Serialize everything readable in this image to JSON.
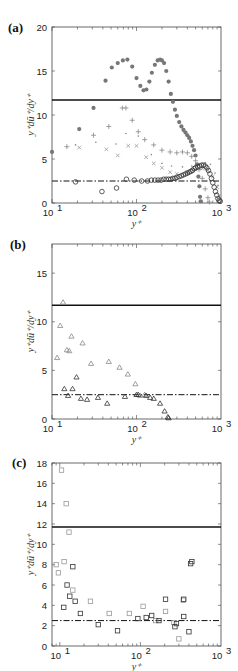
{
  "chart_data": [
    {
      "panel": "(a)",
      "type": "scatter",
      "title": "",
      "xlabel": "y+",
      "ylabel": "y+ dū+/dy+",
      "xscale": "log",
      "xlim": [
        10,
        1000
      ],
      "ylim": [
        0,
        20
      ],
      "xticks": [
        "10^1",
        "10^2",
        "10^3"
      ],
      "yticks": [
        0,
        5,
        10,
        15,
        20
      ],
      "grid": false,
      "reference_lines": [
        {
          "style": "solid",
          "y": 11.7
        },
        {
          "style": "dash-dot",
          "y": 2.5
        }
      ],
      "series": [
        {
          "name": "filled-circles",
          "marker": "filled-circle",
          "color": "#777777",
          "points": [
            [
              10,
              5.8
            ],
            [
              21,
              8.4
            ],
            [
              31,
              10.8
            ],
            [
              43,
              13.9
            ],
            [
              51,
              15.4
            ],
            [
              60,
              15.9
            ],
            [
              69,
              16.2
            ],
            [
              78,
              16.3
            ],
            [
              89,
              15.5
            ],
            [
              100,
              14.2
            ],
            [
              111,
              13.3
            ],
            [
              121,
              12.8
            ],
            [
              131,
              12.9
            ],
            [
              142,
              13.8
            ],
            [
              152,
              14.8
            ],
            [
              165,
              15.7
            ],
            [
              178,
              16.2
            ],
            [
              190,
              16.3
            ],
            [
              200,
              16.2
            ],
            [
              212,
              15.9
            ],
            [
              225,
              15.0
            ],
            [
              240,
              13.8
            ],
            [
              255,
              12.4
            ],
            [
              270,
              11.5
            ],
            [
              285,
              10.6
            ],
            [
              300,
              9.9
            ],
            [
              320,
              9.2
            ],
            [
              340,
              8.7
            ],
            [
              360,
              8.3
            ],
            [
              380,
              8.0
            ],
            [
              400,
              7.7
            ],
            [
              420,
              7.4
            ],
            [
              440,
              7.0
            ],
            [
              460,
              6.5
            ],
            [
              480,
              6.0
            ],
            [
              500,
              5.4
            ],
            [
              520,
              4.4
            ],
            [
              540,
              3.0
            ],
            [
              555,
              1.9
            ],
            [
              565,
              0.7
            ],
            [
              575,
              0.2
            ]
          ]
        },
        {
          "name": "plus",
          "marker": "plus",
          "color": "#888888",
          "points": [
            [
              15,
              6.4
            ],
            [
              31,
              7.7
            ],
            [
              47,
              8.7
            ],
            [
              68,
              10.8
            ],
            [
              75,
              10.8
            ],
            [
              89,
              9.4
            ],
            [
              105,
              8.1
            ],
            [
              125,
              7.2
            ],
            [
              160,
              6.6
            ],
            [
              200,
              6.0
            ],
            [
              250,
              5.8
            ],
            [
              300,
              5.7
            ],
            [
              350,
              5.8
            ],
            [
              400,
              5.7
            ],
            [
              450,
              5.3
            ],
            [
              500,
              4.8
            ],
            [
              550,
              3.8
            ],
            [
              600,
              2.8
            ],
            [
              650,
              1.6
            ],
            [
              700,
              0.6
            ],
            [
              730,
              0.1
            ]
          ]
        },
        {
          "name": "cross-x",
          "marker": "x",
          "color": "#999999",
          "points": [
            [
              21,
              6.3
            ],
            [
              44,
              6.1
            ],
            [
              60,
              5.4
            ],
            [
              80,
              6.5
            ],
            [
              100,
              6.5
            ],
            [
              130,
              5.2
            ],
            [
              160,
              4.5
            ],
            [
              200,
              4.0
            ],
            [
              250,
              3.5
            ],
            [
              300,
              3.3
            ],
            [
              400,
              3.5
            ],
            [
              500,
              3.8
            ],
            [
              600,
              3.9
            ],
            [
              700,
              3.7
            ],
            [
              800,
              3.0
            ],
            [
              900,
              1.8
            ],
            [
              950,
              0.8
            ]
          ]
        },
        {
          "name": "dots",
          "marker": "dot",
          "color": "#888888",
          "points": [
            [
              19,
              6.6
            ],
            [
              33,
              6.9
            ],
            [
              57,
              6.7
            ],
            [
              75,
              7.9
            ],
            [
              105,
              7.6
            ],
            [
              150,
              5.5
            ],
            [
              200,
              4.5
            ],
            [
              260,
              4.2
            ],
            [
              350,
              4.1
            ],
            [
              450,
              4.2
            ],
            [
              550,
              4.4
            ],
            [
              650,
              4.6
            ],
            [
              750,
              4.4
            ],
            [
              850,
              3.4
            ],
            [
              920,
              2.0
            ],
            [
              980,
              0.6
            ]
          ]
        },
        {
          "name": "open-circles",
          "marker": "open-circle",
          "color": "#333333",
          "points": [
            [
              19,
              2.4
            ],
            [
              39,
              1.3
            ],
            [
              58,
              1.7
            ],
            [
              76,
              2.7
            ],
            [
              94,
              2.6
            ],
            [
              115,
              2.5
            ],
            [
              135,
              2.5
            ],
            [
              150,
              2.6
            ],
            [
              165,
              2.6
            ],
            [
              180,
              2.6
            ],
            [
              195,
              2.6
            ],
            [
              210,
              2.7
            ],
            [
              225,
              2.7
            ],
            [
              240,
              2.7
            ],
            [
              255,
              2.7
            ],
            [
              270,
              2.8
            ],
            [
              285,
              2.8
            ],
            [
              300,
              2.9
            ],
            [
              320,
              3.0
            ],
            [
              340,
              3.1
            ],
            [
              360,
              3.2
            ],
            [
              380,
              3.3
            ],
            [
              400,
              3.4
            ],
            [
              420,
              3.5
            ],
            [
              440,
              3.6
            ],
            [
              460,
              3.7
            ],
            [
              480,
              3.9
            ],
            [
              500,
              4.0
            ],
            [
              530,
              4.1
            ],
            [
              560,
              4.2
            ],
            [
              590,
              4.3
            ],
            [
              620,
              4.3
            ],
            [
              650,
              4.2
            ],
            [
              680,
              4.0
            ],
            [
              710,
              3.7
            ],
            [
              740,
              3.3
            ],
            [
              770,
              2.8
            ],
            [
              800,
              2.3
            ],
            [
              830,
              1.8
            ],
            [
              860,
              1.3
            ],
            [
              890,
              0.9
            ],
            [
              920,
              0.5
            ],
            [
              950,
              0.3
            ],
            [
              980,
              0.2
            ]
          ]
        }
      ]
    },
    {
      "panel": "(b)",
      "type": "scatter",
      "title": "",
      "xlabel": "y+",
      "ylabel": "y+ dū+/dy+",
      "xscale": "log",
      "xlim": [
        10,
        1000
      ],
      "ylim": [
        0,
        18
      ],
      "xticks": [
        "10^1",
        "10^2",
        "10^3"
      ],
      "yticks": [
        0,
        5,
        10,
        15
      ],
      "grid": false,
      "reference_lines": [
        {
          "style": "solid",
          "y": 11.7
        },
        {
          "style": "dash-dot",
          "y": 2.5
        }
      ],
      "series": [
        {
          "name": "triangles-light",
          "marker": "open-triangle",
          "color": "#888888",
          "points": [
            [
              11.5,
              6.3
            ],
            [
              12.5,
              9.6
            ],
            [
              13.5,
              12.0
            ],
            [
              15,
              7.1
            ],
            [
              16,
              7.0
            ],
            [
              17,
              8.5
            ],
            [
              23,
              7.8
            ],
            [
              29,
              5.7
            ],
            [
              47,
              5.9
            ],
            [
              63,
              5.3
            ],
            [
              79,
              4.6
            ],
            [
              97,
              3.6
            ],
            [
              110,
              2.4
            ],
            [
              125,
              2.5
            ]
          ]
        },
        {
          "name": "triangles-dark",
          "marker": "open-triangle",
          "color": "#333333",
          "points": [
            [
              14,
              3.1
            ],
            [
              15.5,
              2.4
            ],
            [
              17.5,
              3.1
            ],
            [
              19.5,
              4.3
            ],
            [
              22,
              2.1
            ],
            [
              26,
              2.0
            ],
            [
              35,
              2.2
            ],
            [
              45,
              1.6
            ],
            [
              73,
              2.3
            ],
            [
              100,
              2.5
            ],
            [
              105,
              2.5
            ],
            [
              130,
              2.4
            ],
            [
              145,
              2.2
            ],
            [
              160,
              2.1
            ],
            [
              190,
              1.6
            ],
            [
              215,
              0.8
            ],
            [
              235,
              0.2
            ],
            [
              240,
              0.1
            ]
          ]
        }
      ]
    },
    {
      "panel": "(c)",
      "type": "scatter",
      "title": "",
      "xlabel": "y+",
      "ylabel": "y+ dū+/dy+",
      "xscale": "log",
      "xlim": [
        8,
        1000
      ],
      "ylim": [
        0,
        18
      ],
      "xticks": [
        "10^1",
        "10^2",
        "10^3"
      ],
      "yticks": [
        0,
        2,
        4,
        6,
        8,
        10,
        12,
        14,
        16,
        18
      ],
      "grid": false,
      "reference_lines": [
        {
          "style": "solid",
          "y": 11.7
        },
        {
          "style": "dash-dot",
          "y": 2.5
        }
      ],
      "series": [
        {
          "name": "squares-light",
          "marker": "open-square",
          "color": "#999999",
          "points": [
            [
              9,
              8.0
            ],
            [
              9.6,
              7.2
            ],
            [
              10.5,
              17.3
            ],
            [
              11.3,
              8.3
            ],
            [
              12,
              14.0
            ],
            [
              13,
              11.2
            ],
            [
              14.5,
              5.5
            ],
            [
              24,
              4.4
            ],
            [
              41,
              3.2
            ],
            [
              73,
              3.2
            ],
            [
              108,
              3.9
            ],
            [
              155,
              2.5
            ],
            [
              205,
              3.4
            ],
            [
              260,
              2.3
            ],
            [
              300,
              0.7
            ],
            [
              340,
              4.5
            ]
          ]
        },
        {
          "name": "squares-dark",
          "marker": "open-square",
          "color": "#333333",
          "points": [
            [
              11.2,
              3.8
            ],
            [
              12.3,
              6.0
            ],
            [
              13.3,
              4.9
            ],
            [
              14.5,
              7.8
            ],
            [
              15.5,
              4.4
            ],
            [
              18,
              3.2
            ],
            [
              30,
              2.1
            ],
            [
              52,
              1.5
            ],
            [
              93,
              2.7
            ],
            [
              118,
              2.8
            ],
            [
              138,
              3.0
            ],
            [
              170,
              2.5
            ],
            [
              205,
              4.6
            ],
            [
              268,
              1.9
            ],
            [
              280,
              2.2
            ],
            [
              345,
              2.9
            ],
            [
              345,
              4.6
            ],
            [
              400,
              1.4
            ],
            [
              420,
              8.1
            ],
            [
              435,
              8.3
            ]
          ]
        }
      ]
    }
  ],
  "panels": {
    "a": {
      "label": "(a)",
      "ylabel": "y⁺dū⁺/dy⁺",
      "xlabel": "y⁺",
      "yticks": [
        "0",
        "5",
        "10",
        "15",
        "20"
      ],
      "xticks": [
        "10",
        "10",
        "10"
      ],
      "xexp": [
        "1",
        "2",
        "3"
      ]
    },
    "b": {
      "label": "(b)",
      "ylabel": "y⁺dū⁺/dy⁺",
      "xlabel": "y⁺",
      "yticks": [
        "0",
        "5",
        "10",
        "15"
      ],
      "xticks": [
        "10",
        "10",
        "10"
      ],
      "xexp": [
        "1",
        "2",
        "3"
      ]
    },
    "c": {
      "label": "(c)",
      "ylabel": "y⁺dū⁺/dy⁺",
      "xlabel": "y⁺",
      "yticks": [
        "0",
        "2",
        "4",
        "6",
        "8",
        "10",
        "12",
        "14",
        "16",
        "18"
      ],
      "xticks": [
        "10",
        "10",
        "10"
      ],
      "xexp": [
        "1",
        "2",
        "3"
      ]
    }
  }
}
